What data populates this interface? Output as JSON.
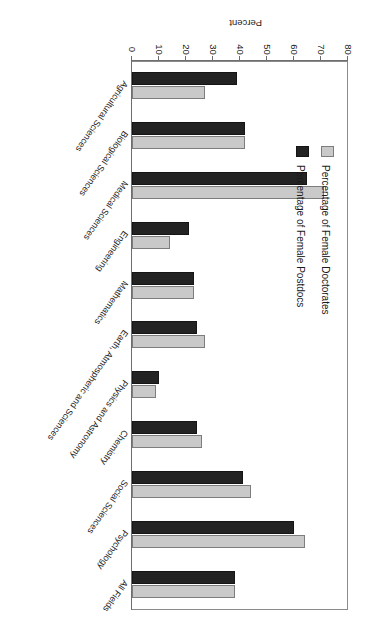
{
  "chart_data": {
    "type": "bar",
    "orientation": "horizontal",
    "title": "",
    "xlabel": "Percent",
    "ylabel": "",
    "xlim": [
      0,
      80
    ],
    "ticks": [
      0,
      10,
      20,
      30,
      40,
      50,
      60,
      70,
      80
    ],
    "grid": false,
    "legend_position": "left-inside",
    "categories": [
      "Agricultural Sciences",
      "Biological Sciences",
      "Medical Sciences",
      "Engineering",
      "Mathematics",
      "Earth, Atmospheric and  Sciences",
      "Physics and Astronomy",
      "Chemistry",
      "Social Sciences",
      "Psychology",
      "All Fields"
    ],
    "series": [
      {
        "name": "Percentage of Female Doctorates",
        "color": "#c9c9c9",
        "values": [
          27,
          42,
          71,
          14,
          23,
          27,
          9,
          26,
          44,
          64,
          38
        ]
      },
      {
        "name": "Percentage of Female Postdocs",
        "color": "#232323",
        "values": [
          39,
          42,
          65,
          21,
          23,
          24,
          10,
          24,
          41,
          60,
          38
        ]
      }
    ]
  },
  "legend": {
    "items": [
      {
        "label": "Percentage of Female Doctorates",
        "swatch": "doctorates"
      },
      {
        "label": "Percentage of Female Postdocs",
        "swatch": "postdocs"
      }
    ]
  }
}
